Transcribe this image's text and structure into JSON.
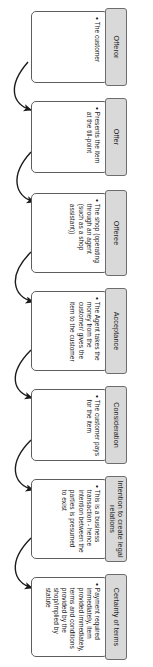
{
  "diagram": {
    "orientation": "rotated-90",
    "colors": {
      "header_fill": "#d9d9d9",
      "header_border": "#6d6d6d",
      "body_fill": "#ffffff",
      "body_border": "#5d5d5d",
      "arrow": "#1b1b1b",
      "text": "#141414"
    },
    "nodes": [
      {
        "id": "offeror",
        "header": "Offeror",
        "bullets": [
          "The customer"
        ]
      },
      {
        "id": "offer",
        "header": "Offer",
        "bullets": [
          "Presents the item at the till-point"
        ]
      },
      {
        "id": "offeree",
        "header": "Offeree",
        "bullets": [
          "The shop (operating through an agent (such as a shop assistant))"
        ]
      },
      {
        "id": "acceptance",
        "header": "Acceptance",
        "bullets": [
          "The Agent takes the money from the customer/ gives the item to the customer"
        ]
      },
      {
        "id": "consideration",
        "header": "Consideration",
        "bullets": [
          "The customer pays for the item"
        ]
      },
      {
        "id": "intention",
        "header": "Intention to create legal relations",
        "bullets": [
          "This is a business transaction - hence intention between the parties is presumed to exist"
        ]
      },
      {
        "id": "certainty",
        "header": "Certainty of terms",
        "bullets": [
          "Payment required immediately, item provided immediately, terms and conditions provided by the shop/implied by statute"
        ]
      }
    ],
    "connectors": [
      {
        "from": "offeror",
        "to": "offer"
      },
      {
        "from": "offer",
        "to": "offeree"
      },
      {
        "from": "offeree",
        "to": "acceptance"
      },
      {
        "from": "acceptance",
        "to": "consideration"
      },
      {
        "from": "consideration",
        "to": "intention"
      },
      {
        "from": "intention",
        "to": "certainty"
      }
    ]
  }
}
